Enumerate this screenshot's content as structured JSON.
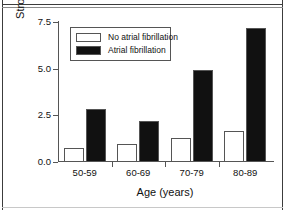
{
  "chart_data": {
    "type": "bar",
    "title": "",
    "subtitle": "",
    "xlabel": "Age (years)",
    "ylabel": "Stroke Rate (% per year)",
    "categories": [
      "50-59",
      "60-69",
      "70-79",
      "80-89"
    ],
    "ylim": [
      0.0,
      7.5
    ],
    "yticks": [
      "0.0",
      "2.5",
      "5.0",
      "7.5"
    ],
    "ytick_values": [
      0.0,
      2.5,
      5.0,
      7.5
    ],
    "grid": false,
    "legend_position": "upper-left-inside",
    "series": [
      {
        "name": "No atrial fibrillation",
        "style": "open",
        "color": "#ffffff",
        "edge_color": "#555555",
        "values": [
          0.7,
          0.9,
          1.25,
          1.6
        ]
      },
      {
        "name": "Atrial fibrillation",
        "style": "filled",
        "color": "#111111",
        "edge_color": "#555555",
        "values": [
          2.8,
          2.15,
          4.9,
          7.1
        ]
      }
    ]
  },
  "legend": {
    "entries": [
      {
        "label": "No atrial fibrillation",
        "swatch": "open-square-swatch"
      },
      {
        "label": "Atrial fibrillation",
        "swatch": "filled-square-swatch"
      }
    ]
  }
}
